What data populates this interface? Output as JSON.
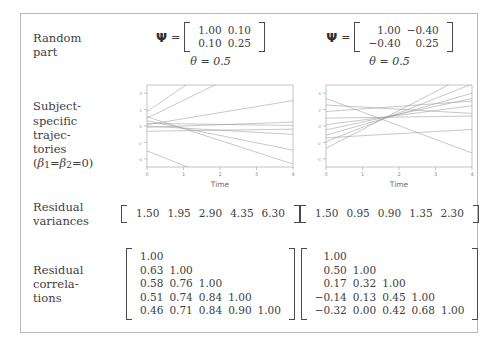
{
  "figure": {
    "border_color": "#b9b9b9",
    "text_color": "#3d3d3d",
    "line_color": "#9a9a9a"
  },
  "rows": [
    {
      "key": "random_part",
      "label_lines": [
        "Random",
        "part"
      ]
    },
    {
      "key": "trajectories",
      "label_lines": [
        "Subject-",
        "specific",
        "trajec-",
        "tories"
      ],
      "label_sub": "(β1=β2=0)"
    },
    {
      "key": "res_var",
      "label_lines": [
        "Residual",
        "variances"
      ]
    },
    {
      "key": "res_corr",
      "label_lines": [
        "Residual",
        "correla-",
        "tions"
      ]
    }
  ],
  "columns": [
    {
      "id": "left",
      "psi_symbol": "Ψ",
      "equals": "=",
      "psi_matrix": [
        [
          "1.00",
          "0.10"
        ],
        [
          "0.10",
          "0.25"
        ]
      ],
      "theta_symbol": "θ",
      "theta_value": "0.5",
      "theta_text": "θ = 0.5",
      "plot": {
        "xlabel": "Time",
        "xticks": [
          "0",
          "1",
          "2",
          "3",
          "4"
        ],
        "yticks": [
          "-4",
          "-2",
          "0",
          "2",
          "4"
        ],
        "xlim": [
          0,
          4
        ],
        "ylim": [
          -5,
          5
        ],
        "lines": [
          {
            "intercept": 0.55,
            "slope": 0.95
          },
          {
            "intercept": 0.3,
            "slope": 0.68
          },
          {
            "intercept": 0.05,
            "slope": 0.23
          },
          {
            "intercept": -0.05,
            "slope": 0.05
          },
          {
            "intercept": 0.1,
            "slope": -0.02
          },
          {
            "intercept": -0.2,
            "slope": 0.02
          },
          {
            "intercept": 0.2,
            "slope": -0.28
          },
          {
            "intercept": 0.35,
            "slope": -0.45
          },
          {
            "intercept": -0.95,
            "slope": -0.55
          },
          {
            "intercept": 0.0,
            "slope": -0.08
          }
        ]
      },
      "residual_variances": [
        "1.50",
        "1.95",
        "2.90",
        "4.35",
        "6.30"
      ],
      "residual_correlations": [
        [
          "1.00"
        ],
        [
          "0.63",
          "1.00"
        ],
        [
          "0.58",
          "0.76",
          "1.00"
        ],
        [
          "0.51",
          "0.74",
          "0.84",
          "1.00"
        ],
        [
          "0.46",
          "0.71",
          "0.84",
          "0.90",
          "1.00"
        ]
      ]
    },
    {
      "id": "right",
      "psi_symbol": "Ψ",
      "equals": "=",
      "psi_matrix": [
        [
          "1.00",
          "−0.40"
        ],
        [
          "−0.40",
          "0.25"
        ]
      ],
      "theta_symbol": "θ",
      "theta_value": "0.5",
      "theta_text": "θ = 0.5",
      "plot": {
        "xlabel": "Time",
        "xticks": [
          "0",
          "1",
          "2",
          "3",
          "4"
        ],
        "yticks": [
          "-4",
          "-2",
          "0",
          "2",
          "4"
        ],
        "xlim": [
          0,
          4
        ],
        "ylim": [
          -5,
          5
        ],
        "lines": [
          {
            "intercept": 1.05,
            "slope": -0.52
          },
          {
            "intercept": 0.8,
            "slope": -0.08
          },
          {
            "intercept": 0.55,
            "slope": 0.1
          },
          {
            "intercept": 0.3,
            "slope": 0.02
          },
          {
            "intercept": 0.05,
            "slope": 0.18
          },
          {
            "intercept": -0.15,
            "slope": 0.3
          },
          {
            "intercept": -0.35,
            "slope": 0.4
          },
          {
            "intercept": -0.6,
            "slope": 0.55
          },
          {
            "intercept": -0.85,
            "slope": 0.72
          },
          {
            "intercept": -0.45,
            "slope": 0.08
          }
        ]
      },
      "residual_variances": [
        "1.50",
        "0.95",
        "0.90",
        "1.35",
        "2.30"
      ],
      "residual_correlations": [
        [
          "1.00"
        ],
        [
          "0.50",
          "1.00"
        ],
        [
          "0.17",
          "0.32",
          "1.00"
        ],
        [
          "−0.14",
          "0.13",
          "0.45",
          "1.00"
        ],
        [
          "−0.32",
          "0.00",
          "0.42",
          "0.68",
          "1.00"
        ]
      ]
    }
  ]
}
